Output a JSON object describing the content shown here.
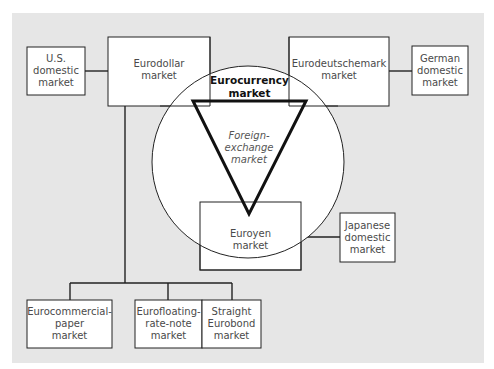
{
  "diagram": {
    "type": "market-relationship-diagram",
    "colors": {
      "background_panel": "#e6e6e6",
      "box_fill": "#ffffff",
      "line": "#222222",
      "label_text": "#4a4a4a",
      "title_text": "#111111"
    },
    "nodes": {
      "us_domestic": {
        "lines": [
          "U.S.",
          "domestic",
          "market"
        ]
      },
      "eurodollar": {
        "lines": [
          "Eurodollar",
          "market"
        ]
      },
      "eurocurrency": {
        "lines": [
          "Eurocurrency",
          "market"
        ]
      },
      "eurodeutschemark": {
        "lines": [
          "Eurodeutschemark",
          "market"
        ]
      },
      "german_domestic": {
        "lines": [
          "German",
          "domestic",
          "market"
        ]
      },
      "foreign_exchange": {
        "lines": [
          "Foreign-",
          "exchange",
          "market"
        ]
      },
      "euroyen": {
        "lines": [
          "Euroyen",
          "market"
        ]
      },
      "japanese_domestic": {
        "lines": [
          "Japanese",
          "domestic",
          "market"
        ]
      },
      "eurocommercial_paper": {
        "lines": [
          "Eurocommercial-",
          "paper",
          "market"
        ]
      },
      "eurofloating_rate_note": {
        "lines": [
          "Eurofloating-",
          "rate-note",
          "market"
        ]
      },
      "straight_eurobond": {
        "lines": [
          "Straight",
          "Eurobond",
          "market"
        ]
      }
    },
    "edges": [
      [
        "us_domestic",
        "eurodollar"
      ],
      [
        "eurodeutschemark",
        "german_domestic"
      ],
      [
        "euroyen",
        "japanese_domestic"
      ],
      [
        "eurodollar",
        "eurocommercial_paper"
      ],
      [
        "eurodollar",
        "eurofloating_rate_note"
      ],
      [
        "eurodollar",
        "straight_eurobond"
      ]
    ]
  }
}
